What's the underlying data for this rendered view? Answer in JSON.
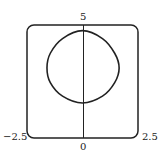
{
  "chart_data": {
    "type": "line",
    "title": "",
    "xlabel": "",
    "ylabel": "",
    "xlim": [
      -2.5,
      2.5
    ],
    "ylim": [
      0,
      5
    ],
    "grid": false,
    "legend": null,
    "tick_labels": {
      "x_min": "−2.5",
      "x_max": "2.5",
      "x_origin": "0",
      "y_max": "5"
    },
    "series": [
      {
        "name": "closed curve",
        "description": "Rounded, slightly diamond-shaped closed curve centered near (0, 3.1)",
        "x": [
          0,
          0.9,
          1.45,
          1.65,
          1.45,
          0.9,
          0,
          -0.9,
          -1.45,
          -1.6,
          -1.45,
          -0.9,
          0
        ],
        "y": [
          4.75,
          4.4,
          3.75,
          3.1,
          2.45,
          1.85,
          1.55,
          1.85,
          2.45,
          3.1,
          3.75,
          4.4,
          4.75
        ]
      }
    ],
    "color": "#222222"
  }
}
